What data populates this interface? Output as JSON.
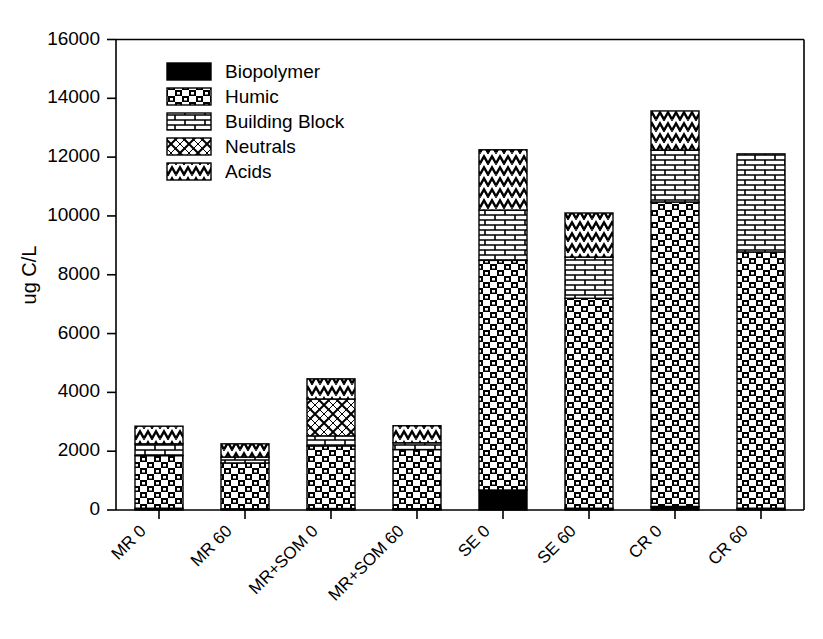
{
  "chart_data": {
    "type": "bar",
    "subtype": "stacked-bar",
    "title": "",
    "xlabel": "",
    "ylabel": "ug C/L",
    "ylim": [
      0,
      16000
    ],
    "yticks": [
      0,
      2000,
      4000,
      6000,
      8000,
      10000,
      12000,
      14000,
      16000
    ],
    "ytick_labels": [
      "0",
      "2000",
      "4000",
      "6000",
      "8000",
      "10000",
      "12000",
      "14000",
      "16000"
    ],
    "grid": false,
    "legend_position": "upper-left-inside",
    "categories": [
      "MR 0",
      "MR 60",
      "MR+SOM 0",
      "MR+SOM 60",
      "SE 0",
      "SE 60",
      "CR 0",
      "CR 60"
    ],
    "series": [
      {
        "name": "Biopolymer",
        "pattern": "solid-black",
        "values": [
          60,
          40,
          50,
          45,
          680,
          60,
          120,
          60
        ]
      },
      {
        "name": "Humic",
        "pattern": "checker",
        "values": [
          1790,
          1560,
          2130,
          2010,
          7810,
          7140,
          10355,
          8715
        ]
      },
      {
        "name": "Building Block",
        "pattern": "brick",
        "values": [
          400,
          200,
          340,
          230,
          1710,
          1400,
          1765,
          3335
        ]
      },
      {
        "name": "Neutrals",
        "pattern": "diamond",
        "values": [
          0,
          0,
          1255,
          0,
          0,
          0,
          0,
          0
        ]
      },
      {
        "name": "Acids",
        "pattern": "zigzag",
        "values": [
          600,
          450,
          685,
          580,
          2050,
          1500,
          1330,
          0
        ]
      }
    ],
    "totals": [
      2850,
      2250,
      4460,
      2865,
      12250,
      10100,
      13570,
      12110
    ]
  },
  "colors": {
    "axis": "#000000",
    "background": "#ffffff",
    "biopolymer": "#000000",
    "pattern_fill": "#ffffff",
    "pattern_ink": "#000000"
  }
}
